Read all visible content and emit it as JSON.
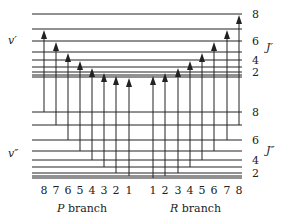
{
  "diagram": {
    "upper_state": {
      "label": "v′",
      "j_label": "J′"
    },
    "lower_state": {
      "label": "v″",
      "j_label": "J″"
    },
    "upper_levels": [
      {
        "J": 8,
        "y": 14,
        "tick": "8"
      },
      {
        "J": 7,
        "y": 29,
        "tick": ""
      },
      {
        "J": 6,
        "y": 41,
        "tick": "6"
      },
      {
        "J": 5,
        "y": 52,
        "tick": ""
      },
      {
        "J": 4,
        "y": 60,
        "tick": "4"
      },
      {
        "J": 3,
        "y": 67,
        "tick": ""
      },
      {
        "J": 2,
        "y": 72,
        "tick": "2"
      },
      {
        "J": 1,
        "y": 75,
        "tick": ""
      },
      {
        "J": 0,
        "y": 77,
        "tick": ""
      }
    ],
    "lower_levels": [
      {
        "J": 8,
        "y": 112,
        "tick": "8"
      },
      {
        "J": 7,
        "y": 125,
        "tick": ""
      },
      {
        "J": 6,
        "y": 140,
        "tick": "6"
      },
      {
        "J": 5,
        "y": 151,
        "tick": ""
      },
      {
        "J": 4,
        "y": 160,
        "tick": "4"
      },
      {
        "J": 3,
        "y": 167,
        "tick": ""
      },
      {
        "J": 2,
        "y": 173,
        "tick": "2"
      },
      {
        "J": 1,
        "y": 176,
        "tick": ""
      },
      {
        "J": 0,
        "y": 178,
        "tick": ""
      }
    ],
    "p_branch": {
      "label_italic": "P",
      "label_rest": " branch",
      "transitions": [
        {
          "n": "8",
          "x": 44,
          "from_J": 8,
          "to_J": 7
        },
        {
          "n": "7",
          "x": 56,
          "from_J": 7,
          "to_J": 6
        },
        {
          "n": "6",
          "x": 68,
          "from_J": 6,
          "to_J": 5
        },
        {
          "n": "5",
          "x": 80,
          "from_J": 5,
          "to_J": 4
        },
        {
          "n": "4",
          "x": 92,
          "from_J": 4,
          "to_J": 3
        },
        {
          "n": "3",
          "x": 104,
          "from_J": 3,
          "to_J": 2
        },
        {
          "n": "2",
          "x": 116,
          "from_J": 2,
          "to_J": 1
        },
        {
          "n": "1",
          "x": 129,
          "from_J": 1,
          "to_J": 0
        }
      ]
    },
    "r_branch": {
      "label_italic": "R",
      "label_rest": " branch",
      "transitions": [
        {
          "n": "1",
          "x": 153,
          "from_J": 0,
          "to_J": 1
        },
        {
          "n": "2",
          "x": 165,
          "from_J": 1,
          "to_J": 2
        },
        {
          "n": "3",
          "x": 178,
          "from_J": 2,
          "to_J": 3
        },
        {
          "n": "4",
          "x": 190,
          "from_J": 3,
          "to_J": 4
        },
        {
          "n": "5",
          "x": 202,
          "from_J": 4,
          "to_J": 5
        },
        {
          "n": "6",
          "x": 214,
          "from_J": 5,
          "to_J": 6
        },
        {
          "n": "7",
          "x": 227,
          "from_J": 6,
          "to_J": 7
        },
        {
          "n": "8",
          "x": 239,
          "from_J": 7,
          "to_J": 8
        }
      ]
    },
    "colors": {
      "line": "#222222",
      "text": "#222222"
    }
  }
}
